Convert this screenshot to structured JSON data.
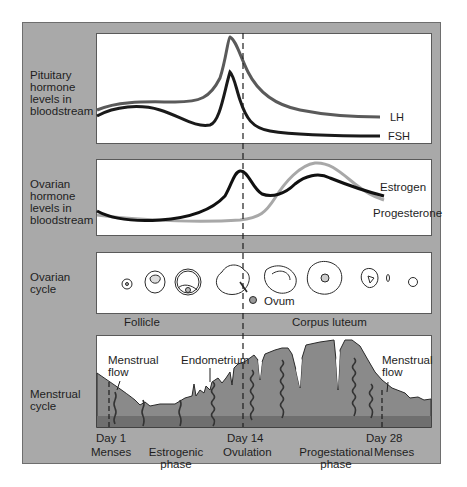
{
  "rows": [
    {
      "label": "Pituitary\nhormone\nlevels in\nbloodstream"
    },
    {
      "label": "Ovarian\nhormone\nlevels in\nbloodstream"
    },
    {
      "label": "Ovarian\ncycle"
    },
    {
      "label": "Menstrual\ncycle"
    }
  ],
  "pituitary": {
    "series": [
      {
        "name": "LH",
        "color": "#5a5a5a"
      },
      {
        "name": "FSH",
        "color": "#1a1a1a"
      }
    ]
  },
  "ovarian_hormones": {
    "series": [
      {
        "name": "Estrogen",
        "color": "#111111"
      },
      {
        "name": "Progesterone",
        "color": "#a8a8a8"
      }
    ]
  },
  "ovarian_cycle": {
    "ovum_label": "Ovum",
    "follicle_label": "Follicle",
    "corpus_luteum_label": "Corpus luteum"
  },
  "menstrual_cycle": {
    "menstrual_flow_left": "Menstrual\nflow",
    "endometrium_label": "Endometrium",
    "menstrual_flow_right": "Menstrual\nflow",
    "tissue_color": "#8a8a8a",
    "base_color": "#6f6f6f"
  },
  "timeline": {
    "markers": [
      {
        "day": "Day 1",
        "event": "Menses"
      },
      {
        "phase": "Estrogenic\nphase"
      },
      {
        "day": "Day 14",
        "event": "Ovulation"
      },
      {
        "phase": "Progestational\nphase"
      },
      {
        "day": "Day 28",
        "event": "Menses"
      }
    ]
  },
  "colors": {
    "frame": "#a9a9a9",
    "panel": "#ffffff"
  }
}
